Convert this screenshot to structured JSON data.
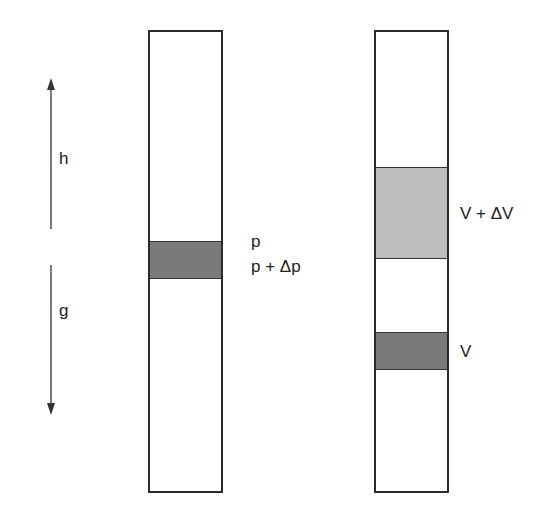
{
  "diagram": {
    "left_arrow": {
      "up_label": "h",
      "down_label": "g"
    },
    "left_column": {
      "band_color": "#7a7a7a",
      "top_label": "p",
      "bottom_label": "p + Δp"
    },
    "right_column": {
      "upper_band_color": "#bdbdbd",
      "upper_label": "V + ΔV",
      "lower_band_color": "#7a7a7a",
      "lower_label": "V"
    }
  }
}
